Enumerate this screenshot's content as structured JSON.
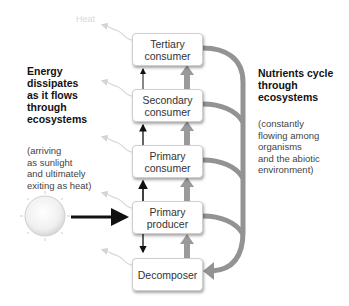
{
  "diagram": {
    "heat_label": "Heat",
    "left_panel": {
      "title": "Energy dissipates as it flows through ecosystems",
      "title_lines": [
        "Energy",
        "dissipates",
        "as it flows",
        "through",
        "ecosystems"
      ],
      "subtitle_lines": [
        "(arriving",
        "as sunlight",
        "and ultimately",
        "exiting as heat)"
      ]
    },
    "right_panel": {
      "title_lines": [
        "Nutrients cycle",
        "through",
        "ecosystems"
      ],
      "subtitle_lines": [
        "(constantly",
        "flowing among",
        "organisms",
        "and the abiotic",
        "environment)"
      ]
    },
    "trophic_levels": [
      {
        "id": "tertiary",
        "line1": "Tertiary",
        "line2": "consumer"
      },
      {
        "id": "secondary",
        "line1": "Secondary",
        "line2": "consumer"
      },
      {
        "id": "primary-consumer",
        "line1": "Primary",
        "line2": "consumer"
      },
      {
        "id": "primary-producer",
        "line1": "Primary",
        "line2": "producer"
      },
      {
        "id": "decomposer",
        "line1": "Decomposer",
        "line2": ""
      }
    ],
    "colors": {
      "energy_arrow": "#111111",
      "nutrient_arrow": "#8f8f8f",
      "heat_arrow": "#dcdcdc",
      "box_border": "#cfcfcf"
    }
  }
}
